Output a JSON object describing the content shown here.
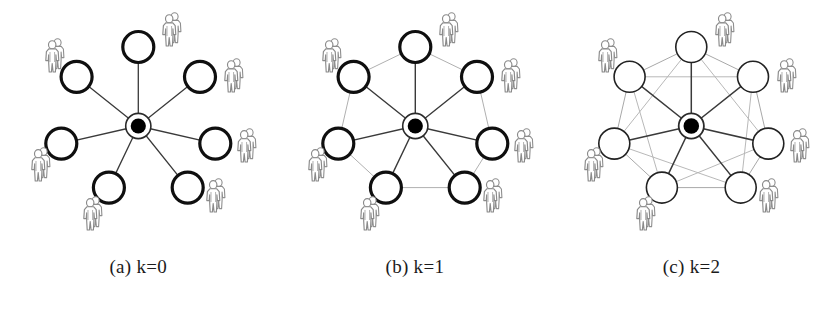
{
  "figure": {
    "background_color": "#ffffff",
    "ink_color": "#1a1a1a",
    "edge_color": "#3c3c3c",
    "faint_edge_color": "#a9a9a9",
    "person_icon_color": "#8d8d8d",
    "hub_fill_color": "#000000",
    "node_fill_color": "#ffffff"
  },
  "panels": [
    {
      "id": "panel-a",
      "caption": "(a) k=0",
      "caption_index": "(a)",
      "caption_value": "k=0",
      "k": 0,
      "icon_name": "star-topology-k0",
      "node_count": 7,
      "hub_count": 1,
      "person_icon_count": 7,
      "node_stroke_width": 3.2,
      "description": "star topology: hub connected to seven peripheral nodes, no peripheral-to-peripheral links",
      "ring_links": "none",
      "mesh_links": "none"
    },
    {
      "id": "panel-b",
      "caption": "(b) k=1",
      "caption_index": "(b)",
      "caption_value": "k=1",
      "k": 1,
      "icon_name": "star-ring-topology-k1",
      "node_count": 7,
      "hub_count": 1,
      "person_icon_count": 7,
      "node_stroke_width": 3.2,
      "description": "star topology plus a faint ring joining each peripheral node to its immediate neighbours",
      "ring_links": "adjacent neighbours",
      "mesh_links": "none"
    },
    {
      "id": "panel-c",
      "caption": "(c) k=2",
      "caption_index": "(c)",
      "caption_value": "k=2",
      "k": 2,
      "icon_name": "star-mesh-topology-k2",
      "node_count": 7,
      "hub_count": 1,
      "person_icon_count": 7,
      "node_stroke_width": 1.6,
      "description": "star topology plus faint links from each peripheral node to neighbours two hops away, forming a dense mesh",
      "ring_links": "adjacent neighbours",
      "mesh_links": "second-order neighbours"
    }
  ],
  "geometry": {
    "center_x": 138.3,
    "center_y": 126,
    "orbit_radius": 79,
    "node_radius": 15.5,
    "hub_outer_radius": 12.5,
    "hub_inner_radius": 7.5,
    "node_angles_deg": [
      -90,
      -141.43,
      -192.86,
      -244.29,
      -295.71,
      -347.14,
      -38.57
    ],
    "node_count": 7
  },
  "nodes": [
    {
      "label_name": "node-top",
      "angle_deg": -90
    },
    {
      "label_name": "node-upper-left",
      "angle_deg": -141.43
    },
    {
      "label_name": "node-left",
      "angle_deg": -192.86
    },
    {
      "label_name": "node-lower-left",
      "angle_deg": -244.29
    },
    {
      "label_name": "node-lower-right",
      "angle_deg": -295.71
    },
    {
      "label_name": "node-right",
      "angle_deg": -347.14
    },
    {
      "label_name": "node-upper-right",
      "angle_deg": -38.57
    }
  ]
}
